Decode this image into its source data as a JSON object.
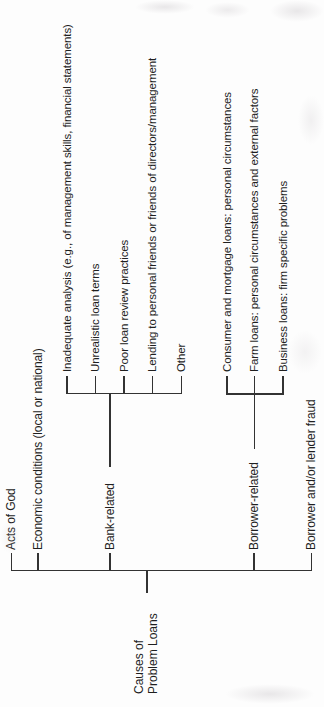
{
  "figure": {
    "root": {
      "line1": "Causes of",
      "line2": "Problem Loans"
    },
    "branches": [
      {
        "label": "Acts of God",
        "children": []
      },
      {
        "label": "Economic conditions (local or national)",
        "children": []
      },
      {
        "label": "Bank-related",
        "children": [
          "Inadequate analysis (e.g., of management skills, financial statements)",
          "Unrealistic loan terms",
          "Poor loan review practices",
          "Lending to personal friends or friends of directors/management",
          "Other"
        ]
      },
      {
        "label": "Borrower-related",
        "children": [
          "Consumer and mortgage loans: personal circumstances",
          "Farm loans: personal circumstances and external factors",
          "Business loans: firm specific problems"
        ]
      },
      {
        "label": "Borrower and/or lender fraud",
        "children": []
      }
    ],
    "colors": {
      "ink": "#333333",
      "text": "#1f1f1f",
      "background": "#fdfdfd"
    }
  }
}
